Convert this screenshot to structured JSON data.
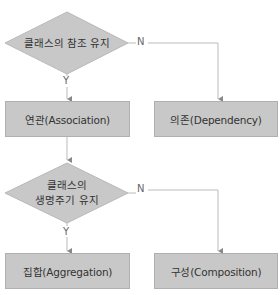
{
  "diagram": {
    "decisions": [
      {
        "id": "d1",
        "label": "클래스의 참조 유지",
        "yes": "Y",
        "no": "N"
      },
      {
        "id": "d2",
        "label_line1": "클래스의",
        "label_line2": "생명주기 유지",
        "yes": "Y",
        "no": "N"
      }
    ],
    "outcomes": [
      {
        "id": "association",
        "label": "연관(Association)"
      },
      {
        "id": "dependency",
        "label": "의존(Dependency)"
      },
      {
        "id": "aggregation",
        "label": "집합(Aggregation)"
      },
      {
        "id": "composition",
        "label": "구성(Composition)"
      }
    ],
    "colors": {
      "fill": "#c8c8c8",
      "stroke": "#b0b0b0",
      "line": "#bbbbbb",
      "text": "#333333"
    }
  }
}
